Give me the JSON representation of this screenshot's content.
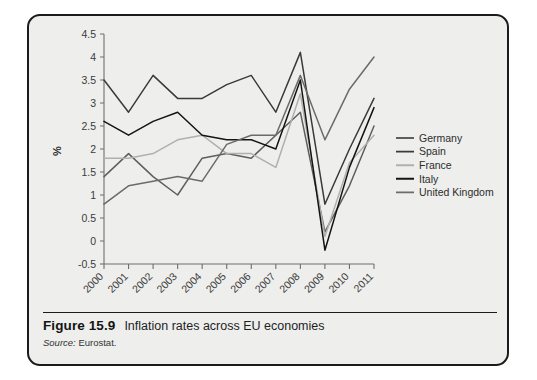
{
  "figure": {
    "number_label": "Figure 15.9",
    "title": "Inflation rates across EU economies",
    "source_label": "Source:",
    "source_value": "Eurostat.",
    "panel_background": "#eeeeec",
    "panel_border_color": "#1b1b1b"
  },
  "chart_data": {
    "type": "line",
    "title": "Inflation rates across EU economies",
    "xlabel": "",
    "ylabel": "%",
    "x": [
      "2000",
      "2001",
      "2002",
      "2003",
      "2004",
      "2005",
      "2006",
      "2007",
      "2008",
      "2009",
      "2010",
      "2011"
    ],
    "categories": [
      "2000",
      "2001",
      "2002",
      "2003",
      "2004",
      "2005",
      "2006",
      "2007",
      "2008",
      "2009",
      "2010",
      "2011"
    ],
    "ylim": [
      -0.5,
      4.5
    ],
    "yticks": [
      "4.5",
      "4",
      "3.5",
      "3",
      "2.5",
      "2",
      "1.5",
      "1",
      "0.5",
      "0",
      "-0.5"
    ],
    "ytick_values": [
      4.5,
      4,
      3.5,
      3,
      2.5,
      2,
      1.5,
      1,
      0.5,
      0,
      -0.5
    ],
    "grid": false,
    "legend_position": "right",
    "series": [
      {
        "name": "Germany",
        "color": "#5e5e5e",
        "values": [
          1.4,
          1.9,
          1.4,
          1.0,
          1.8,
          1.9,
          1.8,
          2.3,
          2.8,
          0.2,
          1.2,
          2.5
        ]
      },
      {
        "name": "Spain",
        "color": "#3a3a3a",
        "values": [
          3.5,
          2.8,
          3.6,
          3.1,
          3.1,
          3.4,
          3.6,
          2.8,
          4.1,
          0.8,
          2.0,
          3.1
        ]
      },
      {
        "name": "France",
        "color": "#b0b0b0",
        "values": [
          1.8,
          1.8,
          1.9,
          2.2,
          2.3,
          1.9,
          1.9,
          1.6,
          3.2,
          0.1,
          1.7,
          2.3
        ]
      },
      {
        "name": "Italy",
        "color": "#141414",
        "values": [
          2.6,
          2.3,
          2.6,
          2.8,
          2.3,
          2.2,
          2.2,
          2.0,
          3.5,
          -0.2,
          1.6,
          2.9
        ]
      },
      {
        "name": "United Kingdom",
        "color": "#6b6b6b",
        "values": [
          0.8,
          1.2,
          1.3,
          1.4,
          1.3,
          2.1,
          2.3,
          2.3,
          3.6,
          2.2,
          3.3,
          4.0
        ]
      }
    ]
  }
}
